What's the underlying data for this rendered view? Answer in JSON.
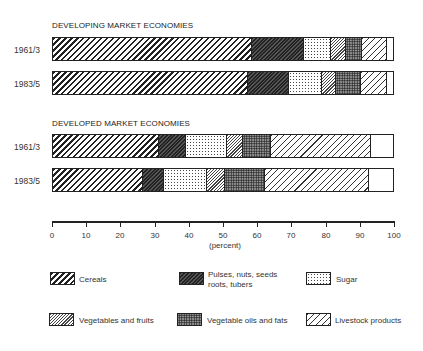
{
  "chart_data": {
    "type": "bar",
    "orientation": "horizontal-stacked-100",
    "title": "",
    "xlabel": "(percent)",
    "ylabel": "",
    "xlim": [
      0,
      100
    ],
    "xticks": [
      0,
      10,
      20,
      30,
      40,
      50,
      60,
      70,
      80,
      90,
      100
    ],
    "groups": [
      {
        "title": "DEVELOPING MARKET ECONOMIES",
        "bars": [
          {
            "label": "1961/3",
            "values": [
              58.5,
              15.2,
              8.2,
              4.4,
              4.6,
              7.3,
              1.8
            ]
          },
          {
            "label": "1983/5",
            "values": [
              57.3,
              12.0,
              9.7,
              4.3,
              7.3,
              7.6,
              1.8
            ]
          }
        ]
      },
      {
        "title": "DEVELOPED MARKET ECONOMIES",
        "bars": [
          {
            "label": "1961/3",
            "values": [
              31.3,
              7.9,
              12.0,
              4.6,
              8.2,
              29.6,
              6.4
            ]
          },
          {
            "label": "1983/5",
            "values": [
              26.6,
              6.1,
              12.6,
              5.3,
              11.7,
              30.7,
              7.0
            ]
          }
        ]
      }
    ],
    "series": [
      {
        "name": "Cereals",
        "pattern": "wide-diagonal-hatch"
      },
      {
        "name": "Pulses, nuts, seeds roots, tubers",
        "pattern": "dark-dense-hatch"
      },
      {
        "name": "Sugar",
        "pattern": "dotted"
      },
      {
        "name": "Vegetables and fruits",
        "pattern": "fine-diagonal-hatch"
      },
      {
        "name": "Vegetable oils and fats",
        "pattern": "dark-stipple"
      },
      {
        "name": "Livestock products",
        "pattern": "light-diagonal-hatch"
      },
      {
        "name": "Other",
        "pattern": "blank"
      }
    ],
    "legend": {
      "position": "bottom",
      "entries": [
        "Cereals",
        "Pulses, nuts, seeds roots, tubers",
        "Sugar",
        "Vegetables and fruits",
        "Vegetable oils and fats",
        "Livestock products"
      ]
    },
    "grid": false
  },
  "labels": {
    "group1_title": "DEVELOPING MARKET ECONOMIES",
    "group2_title": "DEVELOPED MARKET ECONOMIES",
    "row1": "1961/3",
    "row2": "1983/5",
    "xlabel": "(percent)",
    "ticks": [
      "0",
      "10",
      "20",
      "30",
      "40",
      "50",
      "60",
      "70",
      "80",
      "90",
      "100"
    ]
  },
  "legend": {
    "cereals": "Cereals",
    "pulses_l1": "Pulses, nuts, seeds",
    "pulses_l2": "roots, tubers",
    "sugar": "Sugar",
    "veg": "Vegetables and fruits",
    "oils": "Vegetable oils and fats",
    "livestock": "Livestock products"
  }
}
